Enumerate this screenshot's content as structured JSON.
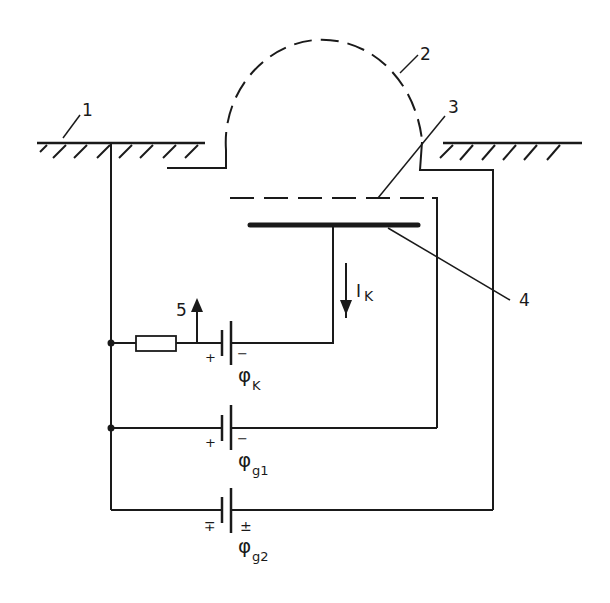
{
  "diagram": {
    "type": "circuit-schematic",
    "labels": {
      "ground": "1",
      "plasma_boundary": "2",
      "grid": "3",
      "collector": "4",
      "output": "5"
    },
    "current_label": "I",
    "current_sub": "K",
    "batteries": [
      {
        "name": "phi",
        "symbol": "φ",
        "sub": "K",
        "left_sign": "+",
        "right_sign": "−"
      },
      {
        "name": "phi",
        "symbol": "φ",
        "sub": "g1",
        "left_sign": "+",
        "right_sign": "−"
      },
      {
        "name": "phi",
        "symbol": "φ",
        "sub": "g2",
        "left_sign": "∓",
        "right_sign": "±"
      }
    ],
    "colors": {
      "line": "#1a1a1a",
      "background": "#ffffff"
    }
  }
}
